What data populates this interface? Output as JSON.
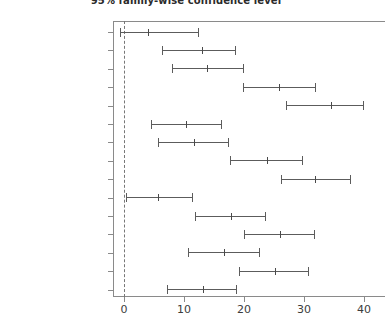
{
  "chart": {
    "title": "95% family-wise confidence level",
    "xlabel": "",
    "ylabel": ""
  },
  "chart_data": {
    "type": "scatter",
    "title": "95% family-wise confidence level",
    "xlabel": "",
    "ylabel": "",
    "xlim": [
      -2,
      41
    ],
    "ylim": [
      0,
      16
    ],
    "grid": false,
    "legend": null,
    "reference_line": {
      "x": 0,
      "style": "dashed",
      "color": "#777777"
    },
    "xticks": [
      0,
      10,
      20,
      30,
      40
    ],
    "xtick_labels": [
      "0",
      "10",
      "20",
      "30",
      "40"
    ],
    "categories": [
      "vulgaris:lo-sativa:lo",
      "sativa:mid-sativa:lo",
      "vulgaris:mid-sativa:lo",
      "vulgaris:hi-sativa:lo",
      "sativa:hi-sativa:lo",
      "sativa:mid-vulgaris:lo",
      "vulgaris:mid-vulgaris:lo",
      "vulgaris:hi-vulgaris:lo",
      "sativa:hi-vulgaris:lo",
      "vulgaris:mid-sativa:mid",
      "vulgaris:hi-sativa:mid",
      "sativa:hi-sativa:mid",
      "vulgaris:hi-vulgaris:mid",
      "sativa:hi-vulgaris:mid",
      "sativa:hi-vulgaris:hi"
    ],
    "series": [
      {
        "name": "difference in means",
        "estimates": [
          4.0,
          13.0,
          13.8,
          25.8,
          34.5,
          10.3,
          11.6,
          23.8,
          31.8,
          5.6,
          17.8,
          26.0,
          16.7,
          25.1,
          13.1
        ],
        "lower": [
          -0.7,
          6.4,
          8.0,
          19.8,
          27.0,
          4.5,
          5.6,
          17.7,
          26.2,
          0.3,
          11.8,
          20.0,
          10.6,
          19.1,
          7.1
        ],
        "upper": [
          12.3,
          18.5,
          19.8,
          31.8,
          39.8,
          16.2,
          17.4,
          29.6,
          37.7,
          11.4,
          23.5,
          31.7,
          22.5,
          30.7,
          18.7
        ]
      }
    ]
  },
  "ylabels": [
    "vulgaris:lo−sativa:lo",
    "sativa:mid−sativa:lo",
    "vulgaris:mid−sativa:lo",
    "vulgaris:hi−sativa:lo",
    "sativa:hi−sativa:lo",
    "sativa:mid−vulgaris:lo",
    "vulgaris:mid−vulgaris:lo",
    "vulgaris:hi−vulgaris:lo",
    "sativa:hi−vulgaris:lo",
    "vulgaris:mid−sativa:mid",
    "vulgaris:hi−sativa:mid",
    "sativa:hi−sativa:mid",
    "vulgaris:hi−vulgaris:mid",
    "sativa:hi−vulgaris:mid",
    "sativa:hi−vulgaris:hi"
  ]
}
